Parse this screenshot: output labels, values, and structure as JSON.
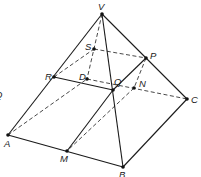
{
  "diagram": {
    "type": "pyramid-section",
    "points": {
      "V": {
        "label": "V",
        "x": 102,
        "y": 14,
        "lx": 98,
        "ly": 10
      },
      "S": {
        "label": "S",
        "x": 94,
        "y": 49,
        "lx": 85,
        "ly": 50
      },
      "P": {
        "label": "P",
        "x": 146,
        "y": 58,
        "lx": 150,
        "ly": 59
      },
      "R": {
        "label": "R",
        "x": 54,
        "y": 77,
        "lx": 45,
        "ly": 80
      },
      "D": {
        "label": "D",
        "x": 87,
        "y": 79,
        "lx": 79,
        "ly": 80
      },
      "Q": {
        "label": "Q",
        "x": 113,
        "y": 90,
        "lx": 114,
        "ly": 85
      },
      "N": {
        "label": "N",
        "x": 134,
        "y": 88,
        "lx": 139,
        "ly": 87
      },
      "C": {
        "label": "C",
        "x": 187,
        "y": 99,
        "lx": 191,
        "ly": 103
      },
      "A": {
        "label": "A",
        "x": 8,
        "y": 135,
        "lx": 4,
        "ly": 147
      },
      "M": {
        "label": "M",
        "x": 67,
        "y": 151,
        "lx": 60,
        "ly": 162
      },
      "B": {
        "label": "B",
        "x": 123,
        "y": 167,
        "lx": 119,
        "ly": 178
      }
    },
    "solid_edges": [
      [
        "V",
        "A"
      ],
      [
        "V",
        "B"
      ],
      [
        "V",
        "C"
      ],
      [
        "A",
        "B"
      ],
      [
        "B",
        "C"
      ],
      [
        "R",
        "Q"
      ],
      [
        "Q",
        "P"
      ],
      [
        "Q",
        "M"
      ]
    ],
    "dashed_edges": [
      [
        "V",
        "D"
      ],
      [
        "A",
        "D"
      ],
      [
        "D",
        "C"
      ],
      [
        "R",
        "S"
      ],
      [
        "S",
        "P"
      ],
      [
        "P",
        "N"
      ],
      [
        "N",
        "M"
      ]
    ],
    "partial_left_label": "Q"
  }
}
